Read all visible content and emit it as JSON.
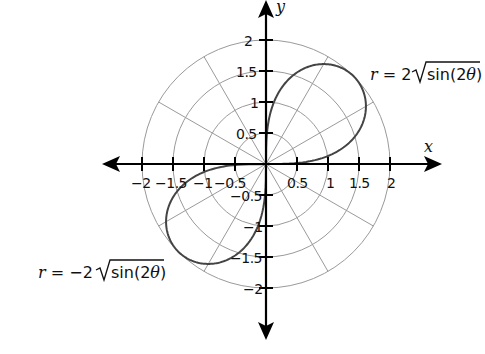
{
  "chart_data": {
    "type": "polar-line",
    "title": "",
    "xlabel": "x",
    "ylabel": "y",
    "xlim": [
      -2,
      2
    ],
    "ylim": [
      -2,
      2
    ],
    "grid": {
      "type": "polar",
      "circles_r": [
        0.5,
        1,
        1.5,
        2
      ],
      "radial_lines_deg": [
        0,
        30,
        60,
        90,
        120,
        150,
        180,
        210,
        240,
        270,
        300,
        330
      ]
    },
    "x_ticks": [
      -2,
      -1.5,
      -1,
      -0.5,
      0.5,
      1,
      1.5,
      2
    ],
    "y_ticks": [
      2,
      1.5,
      1,
      0.5,
      -0.5,
      -1,
      -1.5,
      -2
    ],
    "x_tick_labels": [
      "-2",
      "-1.5",
      "-1",
      "-0.5",
      "0.5",
      "1",
      "1.5",
      "2"
    ],
    "y_tick_labels": [
      "2",
      "1.5",
      "1",
      "0.5",
      "-0.5",
      "-1",
      "-1.5",
      "-2"
    ],
    "series": [
      {
        "name": "r = 2√sin(2θ)",
        "equation": "r = 2*sqrt(sin(2*theta))",
        "theta_range_deg": [
          0,
          90
        ],
        "quadrant": "I",
        "max_r": 2,
        "max_at_theta_deg": 45,
        "color": "#444444"
      },
      {
        "name": "r = −2√sin(2θ)",
        "equation": "r = -2*sqrt(sin(2*theta))",
        "theta_range_deg": [
          0,
          90
        ],
        "quadrant": "III",
        "max_r": 2,
        "max_at_theta_deg": 225,
        "color": "#444444"
      }
    ],
    "annotations": [
      {
        "text": "r = 2√sin(2θ)",
        "position": "upper-right"
      },
      {
        "text": "r = −2√sin(2θ)",
        "position": "lower-left"
      }
    ]
  },
  "labels": {
    "x_axis": "x",
    "y_axis": "y",
    "eq_top": {
      "r": "r",
      "equals": " = 2",
      "sqrt_body": "sin(2",
      "theta": "θ",
      "close": ")"
    },
    "eq_bottom": {
      "r": "r",
      "equals": " = −2",
      "sqrt_body": "sin(2",
      "theta": "θ",
      "close": ")"
    },
    "x_ticks": {
      "n2": "−2",
      "n15": "−1.5",
      "n1": "−1",
      "n05": "−0.5",
      "p05": "0.5",
      "p1": "1",
      "p15": "1.5",
      "p2": "2"
    },
    "y_ticks": {
      "p2": "2",
      "p15": "1.5",
      "p1": "1",
      "p05": "0.5",
      "n05": "−0.5",
      "n1": "−1",
      "n15": "−1.5",
      "n2": "−2"
    }
  },
  "colors": {
    "grid": "#9a9a9a",
    "axis": "#000000",
    "curve": "#3a3a3a",
    "background": "#ffffff"
  }
}
